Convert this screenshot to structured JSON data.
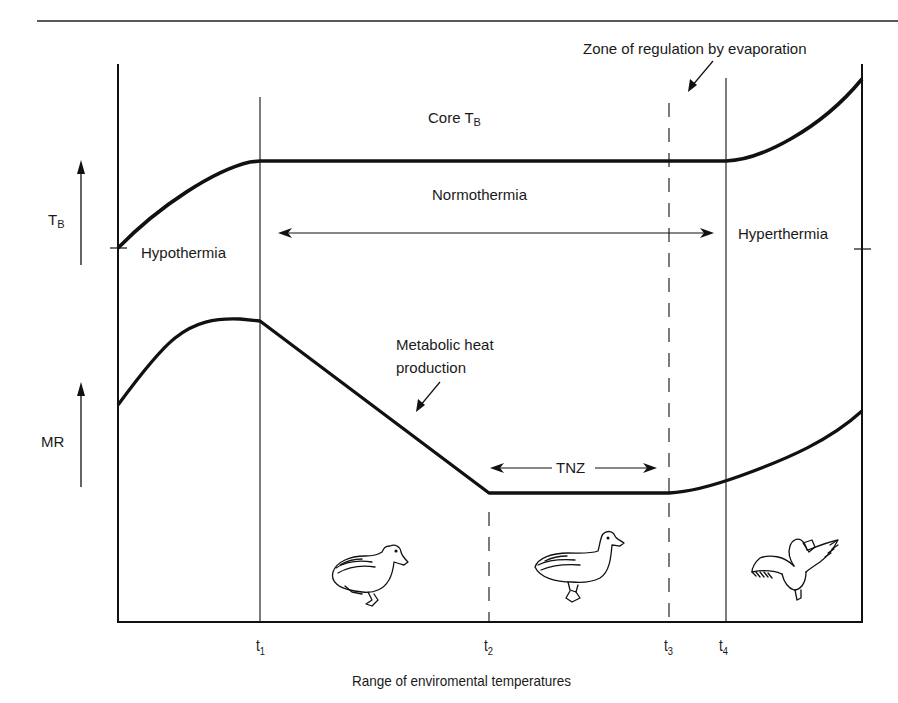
{
  "diagram": {
    "x_axis_label": "Range of enviromental temperatures",
    "y_axes": [
      {
        "label": "T",
        "subscript": "B",
        "meaning": "body temperature"
      },
      {
        "label": "MR",
        "subscript": "",
        "meaning": "metabolic rate"
      }
    ],
    "x_ticks": [
      {
        "label": "t",
        "subscript": "1"
      },
      {
        "label": "t",
        "subscript": "2"
      },
      {
        "label": "t",
        "subscript": "3"
      },
      {
        "label": "t",
        "subscript": "4"
      }
    ],
    "annotations": {
      "core_tb": {
        "text": "Core T",
        "subscript": "B"
      },
      "normothermia": "Normothermia",
      "hypothermia": "Hypothermia",
      "hyperthermia": "Hyperthermia",
      "evaporation": "Zone of regulation by evaporation",
      "metabolic_line1": "Metabolic heat",
      "metabolic_line2": "production",
      "tnz": "TNZ"
    },
    "illustrations": [
      {
        "name": "duck-huddled",
        "zone": "t1-t2",
        "description": "duck sitting hunched (cold)"
      },
      {
        "name": "duck-standing",
        "zone": "t2-t3",
        "description": "duck standing upright (thermoneutral)"
      },
      {
        "name": "duck-panting",
        "zone": "t4+",
        "description": "duck with spread wings and open beak (heat)"
      }
    ],
    "colors": {
      "line": "#111111",
      "background": "#ffffff",
      "text": "#1a1a1a"
    }
  }
}
